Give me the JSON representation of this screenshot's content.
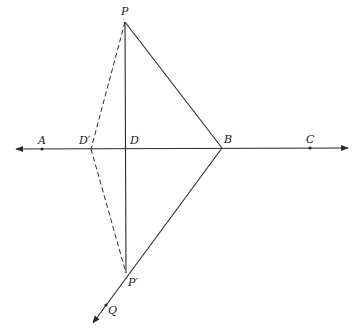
{
  "diagram": {
    "type": "geometric-construction",
    "colors": {
      "line": "#2a2a2a",
      "background": "#ffffff"
    },
    "points": {
      "P": {
        "label": "P",
        "x": 125,
        "y": 22
      },
      "P2": {
        "label": "P′",
        "x": 126,
        "y": 273
      },
      "A": {
        "label": "A",
        "x": 42,
        "y": 149
      },
      "D1": {
        "label": "D′",
        "x": 91,
        "y": 149
      },
      "D": {
        "label": "D",
        "x": 126,
        "y": 149
      },
      "B": {
        "label": "B",
        "x": 222,
        "y": 148
      },
      "C": {
        "label": "C",
        "x": 310,
        "y": 148
      },
      "Q": {
        "label": "Q",
        "x": 106,
        "y": 305
      }
    },
    "line": {
      "name": "line-AC",
      "from_x": 14,
      "to_x": 350,
      "y": 149,
      "arrows": "both"
    },
    "ray": {
      "name": "ray-BQ",
      "from": "B",
      "through": "P′",
      "arrow_end": [
        92,
        325
      ]
    },
    "segments_solid": [
      "P-B",
      "P-P′"
    ],
    "segments_dashed": [
      "P-D′",
      "D′-P′"
    ]
  }
}
